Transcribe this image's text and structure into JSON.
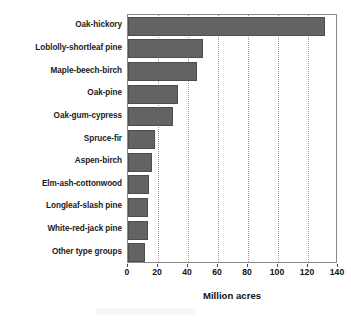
{
  "chart_data": {
    "type": "bar",
    "orientation": "horizontal",
    "title": "",
    "subtitle": "",
    "xlabel": "Million acres",
    "ylabel": "",
    "categories": [
      "Oak-hickory",
      "Loblolly-shortleaf pine",
      "Maple-beech-birch",
      "Oak-pine",
      "Oak-gum-cypress",
      "Spruce-fir",
      "Aspen-birch",
      "Elm-ash-cottonwood",
      "Longleaf-slash pine",
      "White-red-jack pine",
      "Other type groups"
    ],
    "values": [
      131,
      50,
      46,
      33,
      30,
      18,
      16,
      14,
      13,
      13,
      11
    ],
    "xlim": [
      0,
      140
    ],
    "xticks": [
      0,
      20,
      40,
      60,
      80,
      100,
      120,
      140
    ],
    "xtick_labels": [
      "0",
      "20",
      "40",
      "60",
      "80",
      "100",
      "120",
      "140"
    ],
    "grid": "vertical-dotted",
    "legend": "none",
    "bar_color": "#636363",
    "bar_edge_color": "#4e4e4e",
    "frame_color": "#8a8a8a",
    "background": "#ffffff",
    "text_color": "#111111"
  }
}
